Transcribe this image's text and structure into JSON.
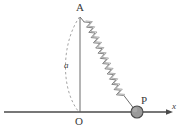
{
  "figure": {
    "type": "physics-diagram",
    "background_color": "#ffffff",
    "stroke_color": "#4a4a4a",
    "dash_color": "#8a8a8a",
    "spring_color": "#6e6e6e",
    "bob_fill_color": "#9a9a9a",
    "bob_stroke_color": "#4a4a4a",
    "label_color": "#3a3a3a",
    "labels": {
      "apex": "A",
      "origin": "O",
      "mass": "P",
      "radius": "a",
      "axis": "x"
    },
    "geometry": {
      "apex_point": [
        80,
        16
      ],
      "origin_point": [
        80,
        112
      ],
      "mass_point": [
        137,
        112
      ],
      "mass_radius": 6,
      "axis_start": [
        4,
        112
      ],
      "axis_end": [
        170,
        112
      ],
      "axis_arrow_length": 6,
      "spring_coils": 26,
      "spring_amplitude": 5,
      "arc_radius": 96
    }
  }
}
